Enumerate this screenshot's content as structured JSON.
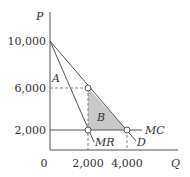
{
  "diagram": {
    "type": "monopoly-deadweight-loss",
    "axes": {
      "y_label": "P",
      "x_label": "Q",
      "origin_label": "0",
      "y_ticks": [
        "10,000",
        "6,000",
        "2,000"
      ],
      "x_ticks": [
        "2,000",
        "4,000"
      ]
    },
    "curves": {
      "demand": "D",
      "marginal_revenue": "MR",
      "marginal_cost": "MC"
    },
    "regions": {
      "a": "A",
      "b": "B"
    },
    "colors": {
      "line": "#555555",
      "shade": "#c8c8c8",
      "text": "#333333"
    }
  }
}
